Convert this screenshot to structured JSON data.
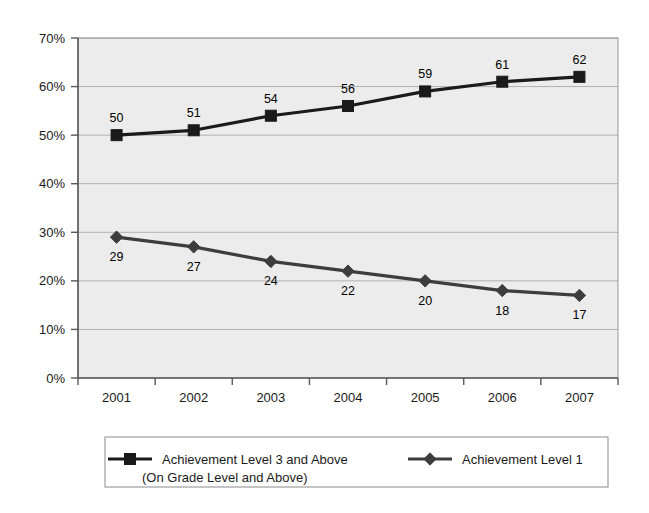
{
  "chart_data": {
    "type": "line",
    "title": "",
    "xlabel": "",
    "ylabel": "",
    "categories": [
      "2001",
      "2002",
      "2003",
      "2004",
      "2005",
      "2006",
      "2007"
    ],
    "ylim": [
      0,
      70
    ],
    "ytick_labels": [
      "0%",
      "10%",
      "20%",
      "30%",
      "40%",
      "50%",
      "60%",
      "70%"
    ],
    "ytick_values": [
      0,
      10,
      20,
      30,
      40,
      50,
      60,
      70
    ],
    "grid": "horizontal",
    "legend_position": "bottom",
    "plot_background": "#ececec",
    "gridline_color": "#b0b0b0",
    "axis_color": "#595959",
    "series": [
      {
        "name": "Achievement Level 3 and Above",
        "name_line2": "(On Grade Level and Above)",
        "marker": "square",
        "color": "#1a1a1a",
        "values": [
          50,
          51,
          54,
          56,
          59,
          61,
          62
        ],
        "labels": [
          "50",
          "51",
          "54",
          "56",
          "59",
          "61",
          "62"
        ],
        "label_position": "above"
      },
      {
        "name": "Achievement Level 1",
        "marker": "diamond",
        "color": "#3d3d3d",
        "values": [
          29,
          27,
          24,
          22,
          20,
          18,
          17
        ],
        "labels": [
          "29",
          "27",
          "24",
          "22",
          "20",
          "18",
          "17"
        ],
        "label_position": "below"
      }
    ]
  },
  "legend": {
    "entries": [
      {
        "label": "Achievement Level 3 and Above",
        "sublabel": "(On Grade Level and Above)",
        "marker": "square"
      },
      {
        "label": "Achievement Level 1",
        "sublabel": "",
        "marker": "diamond"
      }
    ]
  }
}
